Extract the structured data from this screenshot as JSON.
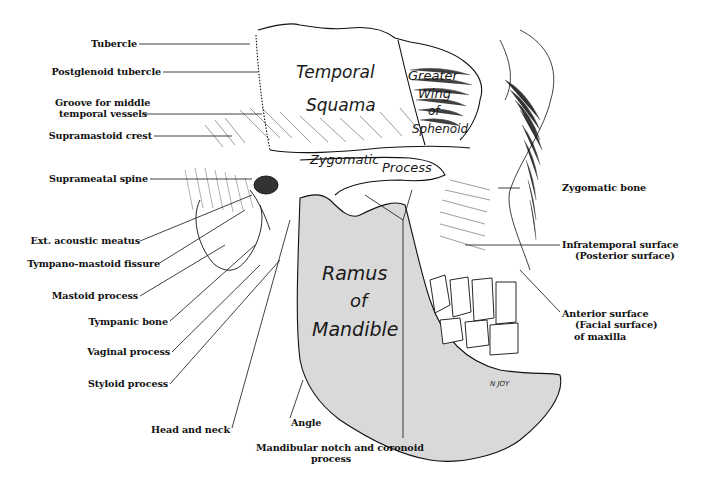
{
  "figure": {
    "artist_signature": "N JOY",
    "colors": {
      "ink": "#111111",
      "mandible_fill": "#d9d9d9",
      "background": "#ffffff"
    }
  },
  "regions": {
    "temporal_squama": [
      "Temporal",
      "Squama"
    ],
    "greater_wing": [
      "Greater",
      "Wing",
      "of",
      "Sphenoid"
    ],
    "zygomatic_process": [
      "Zygomatic",
      "Process"
    ],
    "ramus": [
      "Ramus",
      "of",
      "Mandible"
    ]
  },
  "labels_left": [
    {
      "id": "tubercle",
      "text": "Tubercle"
    },
    {
      "id": "postglenoid-tubercle",
      "text": "Postglenoid tubercle"
    },
    {
      "id": "groove-middle-temporal",
      "lines": [
        "Groove for middle",
        "temporal vessels"
      ]
    },
    {
      "id": "supramastoid-crest",
      "text": "Supramastoid crest"
    },
    {
      "id": "suprameatal-spine",
      "text": "Suprameatal spine"
    },
    {
      "id": "ext-acoustic-meatus",
      "text": "Ext. acoustic meatus"
    },
    {
      "id": "tympano-mastoid-fissure",
      "text": "Tympano-mastoid fissure"
    },
    {
      "id": "mastoid-process",
      "text": "Mastoid process"
    },
    {
      "id": "tympanic-bone",
      "text": "Tympanic bone"
    },
    {
      "id": "vaginal-process",
      "text": "Vaginal process"
    },
    {
      "id": "styloid-process",
      "text": "Styloid process"
    },
    {
      "id": "head-and-neck",
      "text": "Head and neck"
    }
  ],
  "labels_bottom": [
    {
      "id": "angle",
      "text": "Angle"
    },
    {
      "id": "mandibular-notch",
      "lines": [
        "Mandibular notch and coronoid",
        "process"
      ]
    }
  ],
  "labels_right": [
    {
      "id": "zygomatic-bone",
      "text": "Zygomatic bone"
    },
    {
      "id": "infratemporal-surface",
      "lines": [
        "Infratemporal surface",
        "(Posterior surface)"
      ]
    },
    {
      "id": "anterior-surface",
      "lines": [
        "Anterior surface",
        "(Facial surface)",
        "of maxilla"
      ]
    }
  ]
}
